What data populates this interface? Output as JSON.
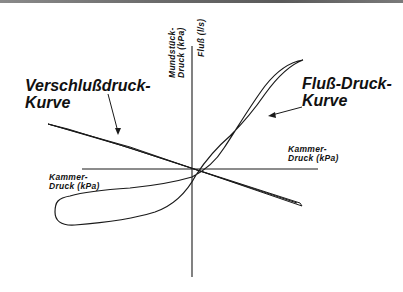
{
  "labels": {
    "occlusion_curve_line1": "Verschlußdruck-",
    "occlusion_curve_line2": "Kurve",
    "flow_curve_line1": "Fluß-Druck-",
    "flow_curve_line2": "Kurve",
    "y_axis_upper_line1": "Mundstück-",
    "y_axis_upper_line2": "Druck (kPa)",
    "y_axis_flow": "Fluß (l/s)",
    "x_axis_right_line1": "Kammer-",
    "x_axis_right_line2": "Druck (kPa)",
    "x_axis_left_line1": "Kammer-",
    "x_axis_left_line2": "Druck (kPa)"
  },
  "colors": {
    "line": "#1a1a1a",
    "background": "#ffffff",
    "text": "#111111"
  }
}
